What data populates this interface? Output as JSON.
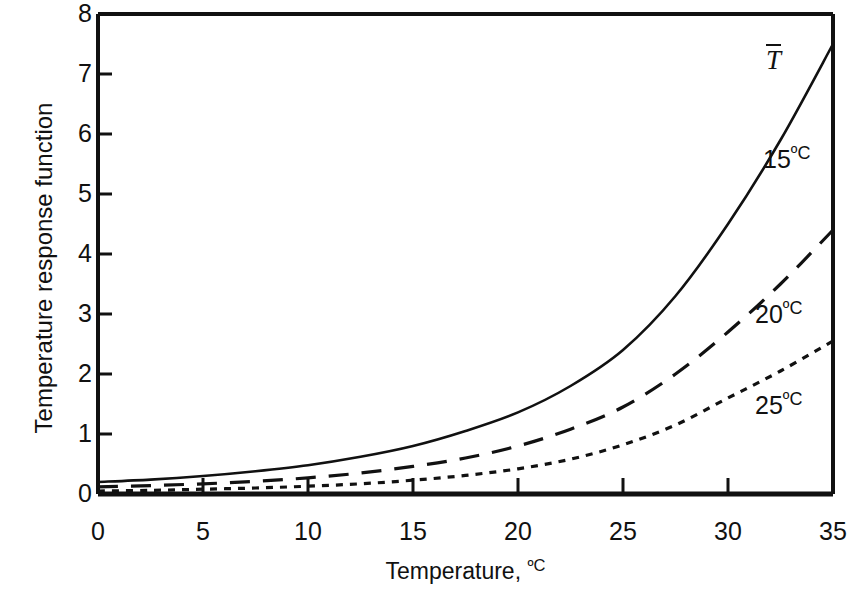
{
  "chart_data": {
    "type": "line",
    "title": "",
    "xlabel": "Temperature, ºC",
    "ylabel": "Temperature response function",
    "xlim": [
      0,
      35
    ],
    "ylim": [
      0,
      8
    ],
    "xticks": [
      0,
      5,
      10,
      15,
      20,
      25,
      30,
      35
    ],
    "yticks": [
      0,
      1,
      2,
      3,
      4,
      5,
      6,
      7,
      8
    ],
    "xtick_labels": [
      "0",
      "5",
      "10",
      "15",
      "20",
      "25",
      "30",
      "35"
    ],
    "ytick_labels": [
      "0",
      "1",
      "2",
      "3",
      "4",
      "5",
      "6",
      "7",
      "8"
    ],
    "grid": false,
    "legend_position": "inline-annotations",
    "x": [
      0,
      2.5,
      5,
      7.5,
      10,
      12.5,
      15,
      17.5,
      20,
      22.5,
      25,
      27.5,
      30,
      32.5,
      35
    ],
    "series": [
      {
        "name": "T̄",
        "label": "T̄",
        "style": "solid",
        "color": "#111111",
        "values": [
          0.2,
          0.24,
          0.3,
          0.38,
          0.48,
          0.62,
          0.8,
          1.05,
          1.36,
          1.8,
          2.4,
          3.3,
          4.5,
          5.9,
          7.5
        ]
      },
      {
        "name": "20ºC",
        "label": "20ºC",
        "style": "dashed",
        "color": "#111111",
        "values": [
          0.12,
          0.14,
          0.17,
          0.21,
          0.27,
          0.35,
          0.46,
          0.6,
          0.8,
          1.08,
          1.45,
          2.0,
          2.7,
          3.5,
          4.4
        ]
      },
      {
        "name": "25ºC",
        "label": "25ºC",
        "style": "dotted",
        "color": "#111111",
        "values": [
          0.05,
          0.06,
          0.08,
          0.1,
          0.13,
          0.17,
          0.23,
          0.31,
          0.42,
          0.58,
          0.82,
          1.15,
          1.6,
          2.05,
          2.55
        ]
      }
    ],
    "annotations": [
      {
        "text": "T̄",
        "x": 32.2,
        "y": 7.2
      },
      {
        "text": "15ºC",
        "x": 32.0,
        "y": 5.6
      },
      {
        "text": "20ºC",
        "x": 31.6,
        "y": 3.05
      },
      {
        "text": "25ºC",
        "x": 31.6,
        "y": 1.55
      }
    ]
  },
  "axes": {
    "y_title": "Temperature response function",
    "x_title_main": "Temperature, ",
    "x_title_unit": "ºC"
  },
  "curve_labels": {
    "tbar": "T",
    "c15_value": "15",
    "c15_unit": "ºC",
    "c20_value": "20",
    "c20_unit": "ºC",
    "c25_value": "25",
    "c25_unit": "ºC"
  }
}
